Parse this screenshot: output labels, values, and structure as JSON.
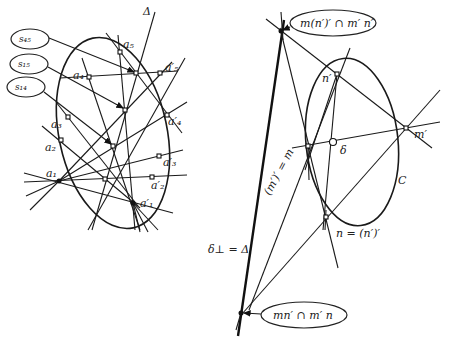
{
  "figure_left": {
    "delta_label": "Δ",
    "callouts": [
      {
        "id": "s45",
        "label": "s₄₅"
      },
      {
        "id": "s15",
        "label": "s₁₅"
      },
      {
        "id": "s14",
        "label": "s₁₄"
      }
    ],
    "points": {
      "a1": "a₁",
      "a2": "a₂",
      "a3": "a₃",
      "a4": "a₄",
      "a5": "a₅",
      "a1p": "a′₁",
      "a2p": "a′₂",
      "a3p": "a′₃",
      "a4p": "a′₄",
      "a5p": "a′₅"
    }
  },
  "figure_right": {
    "callout_top": "m(n′)′ ∩ m′ n′",
    "callout_bottom": "mn′ ∩ m′ n",
    "labels": {
      "n_prime": "n′",
      "m_prime": "m′",
      "delta": "δ",
      "curve": "C",
      "m_eq": "(m′)′ = m",
      "n_eq": "n = (n′)′",
      "delta_perp": "δ⊥ = Δ"
    }
  }
}
